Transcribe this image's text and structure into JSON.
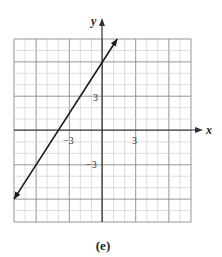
{
  "chart_data": {
    "type": "line",
    "title": "",
    "caption": "(e)",
    "xlabel": "x",
    "ylabel": "y",
    "xlim": [
      -8,
      8
    ],
    "ylim": [
      -8,
      8
    ],
    "grid": true,
    "minor_grid_step": 1,
    "major_grid_step": 3,
    "x_tick_labels": [
      {
        "value": -3,
        "label": "−3"
      },
      {
        "value": 3,
        "label": "3"
      }
    ],
    "y_tick_labels": [
      {
        "value": 3,
        "label": "3"
      },
      {
        "value": -3,
        "label": "−3"
      }
    ],
    "series": [
      {
        "name": "line",
        "equation": "y = 1.5x + 6",
        "slope": 1.5,
        "intercept": 6,
        "x_intercept": -4,
        "points": [
          [
            -8,
            -6
          ],
          [
            -4,
            0
          ],
          [
            0,
            6
          ],
          [
            1.33,
            8
          ]
        ],
        "arrows_both_ends": true
      }
    ]
  },
  "labels": {
    "x_axis": "x",
    "y_axis": "y",
    "x_tick_neg3": "−3",
    "x_tick_pos3": "3",
    "y_tick_pos3": "3",
    "y_tick_neg3": "−3",
    "caption": "(e)"
  },
  "colors": {
    "grid_minor": "#c8c8c8",
    "grid_major": "#8a8a8a",
    "axis": "#333333",
    "line": "#1a1a1a"
  }
}
